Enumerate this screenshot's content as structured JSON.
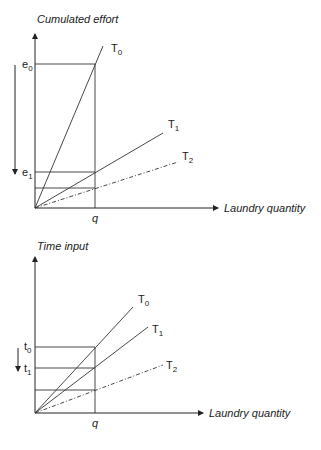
{
  "top_diagram": {
    "y_axis_label": "Cumulated effort",
    "x_axis_label": "Laundry quantity",
    "x_marker": "q",
    "levels": [
      {
        "label": "e",
        "sub": "0"
      },
      {
        "label": "e",
        "sub": "1"
      }
    ],
    "lines": [
      {
        "label": "T",
        "sub": "0",
        "style": "solid"
      },
      {
        "label": "T",
        "sub": "1",
        "style": "solid"
      },
      {
        "label": "T",
        "sub": "2",
        "style": "dash-dot"
      }
    ]
  },
  "bottom_diagram": {
    "y_axis_label": "Time input",
    "x_axis_label": "Laundry quantity",
    "x_marker": "q",
    "levels": [
      {
        "label": "t",
        "sub": "0"
      },
      {
        "label": "t",
        "sub": "1"
      }
    ],
    "lines": [
      {
        "label": "T",
        "sub": "0",
        "style": "solid"
      },
      {
        "label": "T",
        "sub": "1",
        "style": "solid"
      },
      {
        "label": "T",
        "sub": "2",
        "style": "dash-dot"
      }
    ]
  }
}
